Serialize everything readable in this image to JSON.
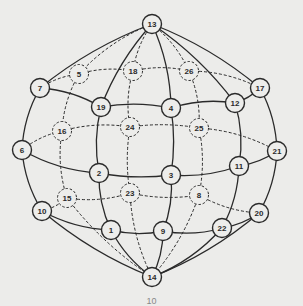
{
  "diagram": {
    "type": "sphere-graph",
    "colors": {
      "background": "#ececea",
      "stroke": "#2a2a2a",
      "node_fill": "#ededeb",
      "label": "#2a2a2a"
    },
    "caption": "10",
    "nodes": [
      {
        "id": "1",
        "x": 111,
        "y": 230,
        "hidden": false
      },
      {
        "id": "2",
        "x": 99,
        "y": 173,
        "hidden": false
      },
      {
        "id": "3",
        "x": 171,
        "y": 175,
        "hidden": false
      },
      {
        "id": "4",
        "x": 171,
        "y": 108,
        "hidden": false
      },
      {
        "id": "5",
        "x": 79,
        "y": 74,
        "hidden": true
      },
      {
        "id": "6",
        "x": 22,
        "y": 150,
        "hidden": false
      },
      {
        "id": "7",
        "x": 40,
        "y": 88,
        "hidden": false
      },
      {
        "id": "8",
        "x": 199,
        "y": 195,
        "hidden": true
      },
      {
        "id": "9",
        "x": 163,
        "y": 231,
        "hidden": false
      },
      {
        "id": "10",
        "x": 42,
        "y": 211,
        "hidden": false
      },
      {
        "id": "11",
        "x": 239,
        "y": 166,
        "hidden": false
      },
      {
        "id": "12",
        "x": 235,
        "y": 103,
        "hidden": false
      },
      {
        "id": "13",
        "x": 152,
        "y": 24,
        "hidden": false
      },
      {
        "id": "14",
        "x": 152,
        "y": 277,
        "hidden": false
      },
      {
        "id": "15",
        "x": 67,
        "y": 198,
        "hidden": true
      },
      {
        "id": "16",
        "x": 62,
        "y": 131,
        "hidden": true
      },
      {
        "id": "17",
        "x": 260,
        "y": 88,
        "hidden": false
      },
      {
        "id": "18",
        "x": 133,
        "y": 71,
        "hidden": true
      },
      {
        "id": "19",
        "x": 101,
        "y": 107,
        "hidden": false
      },
      {
        "id": "20",
        "x": 259,
        "y": 213,
        "hidden": false
      },
      {
        "id": "21",
        "x": 277,
        "y": 151,
        "hidden": false
      },
      {
        "id": "22",
        "x": 222,
        "y": 228,
        "hidden": false
      },
      {
        "id": "23",
        "x": 130,
        "y": 193,
        "hidden": true
      },
      {
        "id": "24",
        "x": 130,
        "y": 127,
        "hidden": true
      },
      {
        "id": "25",
        "x": 199,
        "y": 128,
        "hidden": true
      },
      {
        "id": "26",
        "x": 189,
        "y": 71,
        "hidden": true
      }
    ],
    "edges_solid": [
      [
        "13",
        "7"
      ],
      [
        "7",
        "6"
      ],
      [
        "6",
        "10"
      ],
      [
        "10",
        "14"
      ],
      [
        "13",
        "17"
      ],
      [
        "17",
        "21"
      ],
      [
        "21",
        "20"
      ],
      [
        "20",
        "14"
      ],
      [
        "13",
        "19"
      ],
      [
        "19",
        "2"
      ],
      [
        "2",
        "1"
      ],
      [
        "1",
        "14"
      ],
      [
        "13",
        "4"
      ],
      [
        "4",
        "3"
      ],
      [
        "3",
        "9"
      ],
      [
        "9",
        "14"
      ],
      [
        "13",
        "12"
      ],
      [
        "12",
        "11"
      ],
      [
        "11",
        "22"
      ],
      [
        "22",
        "14"
      ],
      [
        "7",
        "19"
      ],
      [
        "19",
        "4"
      ],
      [
        "4",
        "12"
      ],
      [
        "12",
        "17"
      ],
      [
        "6",
        "2"
      ],
      [
        "2",
        "3"
      ],
      [
        "3",
        "11"
      ],
      [
        "11",
        "21"
      ],
      [
        "10",
        "1"
      ],
      [
        "1",
        "9"
      ],
      [
        "9",
        "22"
      ],
      [
        "22",
        "20"
      ]
    ],
    "edges_dashed": [
      [
        "13",
        "5"
      ],
      [
        "5",
        "16"
      ],
      [
        "16",
        "15"
      ],
      [
        "15",
        "14"
      ],
      [
        "13",
        "18"
      ],
      [
        "18",
        "24"
      ],
      [
        "24",
        "23"
      ],
      [
        "23",
        "14"
      ],
      [
        "13",
        "26"
      ],
      [
        "26",
        "25"
      ],
      [
        "25",
        "8"
      ],
      [
        "8",
        "14"
      ],
      [
        "7",
        "5"
      ],
      [
        "5",
        "18"
      ],
      [
        "18",
        "26"
      ],
      [
        "26",
        "17"
      ],
      [
        "6",
        "16"
      ],
      [
        "16",
        "24"
      ],
      [
        "24",
        "25"
      ],
      [
        "25",
        "21"
      ],
      [
        "10",
        "15"
      ],
      [
        "15",
        "23"
      ],
      [
        "23",
        "8"
      ],
      [
        "8",
        "20"
      ]
    ]
  }
}
